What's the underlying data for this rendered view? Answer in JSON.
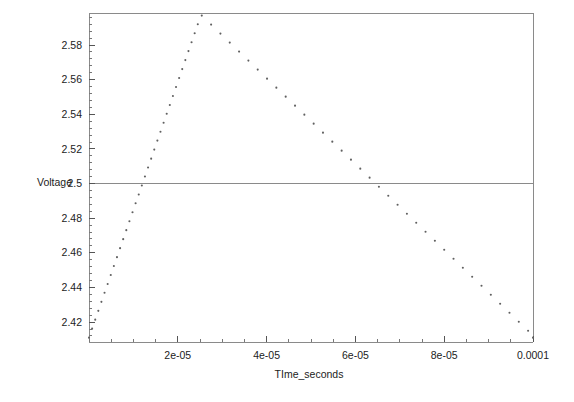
{
  "chart_data": {
    "type": "scatter",
    "title": "",
    "xlabel": "TIme_seconds",
    "ylabel": "Voltage",
    "xlim": [
      0,
      0.0001
    ],
    "ylim": [
      2.4085,
      2.5985
    ],
    "grid": false,
    "legend": null,
    "marker": "dot",
    "marker_color": "#606060",
    "reference_lines": [
      {
        "axis": "y",
        "value": 2.5,
        "color": "#8a8a8a"
      }
    ],
    "x_major_ticks": [
      2e-05,
      4e-05,
      6e-05,
      8e-05,
      0.0001
    ],
    "x_major_tick_labels": [
      "2e-05",
      "4e-05",
      "6e-05",
      "8e-05",
      "0.0001"
    ],
    "x_minor_tick_step": 5e-06,
    "y_major_ticks": [
      2.42,
      2.44,
      2.46,
      2.48,
      2.5,
      2.52,
      2.54,
      2.56,
      2.58
    ],
    "y_major_tick_labels": [
      "2.42",
      "2.44",
      "2.46",
      "2.48",
      "2.5",
      "2.52",
      "2.54",
      "2.56",
      "2.58"
    ],
    "y_minor_tick_step": 0.004,
    "series": [
      {
        "name": "Voltage",
        "x": [
          0.0,
          7e-07,
          1.4e-06,
          2.1e-06,
          2.8e-06,
          3.5e-06,
          4.2e-06,
          4.9e-06,
          5.6e-06,
          6.3e-06,
          7e-06,
          7.7e-06,
          8.4e-06,
          9.1e-06,
          9.8e-06,
          1.05e-05,
          1.12e-05,
          1.19e-05,
          1.26e-05,
          1.33e-05,
          1.4e-05,
          1.47e-05,
          1.54e-05,
          1.61e-05,
          1.68e-05,
          1.75e-05,
          1.82e-05,
          1.89e-05,
          1.96e-05,
          2.03e-05,
          2.1e-05,
          2.17e-05,
          2.24e-05,
          2.31e-05,
          2.38e-05,
          2.45e-05,
          2.54e-05,
          2.75e-05,
          2.96e-05,
          3.17e-05,
          3.38e-05,
          3.59e-05,
          3.8e-05,
          4.01e-05,
          4.22e-05,
          4.43e-05,
          4.64e-05,
          4.85e-05,
          5.06e-05,
          5.27e-05,
          5.48e-05,
          5.69e-05,
          5.9e-05,
          6.11e-05,
          6.32e-05,
          6.53e-05,
          6.74e-05,
          6.95e-05,
          7.16e-05,
          7.37e-05,
          7.58e-05,
          7.79e-05,
          8e-05,
          8.21e-05,
          8.42e-05,
          8.63e-05,
          8.84e-05,
          9.05e-05,
          9.26e-05,
          9.47e-05,
          9.68e-05,
          9.89e-05,
          0.0001
        ],
        "y": [
          2.411,
          2.4162,
          2.4214,
          2.4265,
          2.4317,
          2.4369,
          2.442,
          2.4472,
          2.4524,
          2.4575,
          2.4627,
          2.4679,
          2.4731,
          2.4782,
          2.4834,
          2.4886,
          2.4937,
          2.4989,
          2.5041,
          2.5093,
          2.5144,
          2.5196,
          2.5248,
          2.5299,
          2.5351,
          2.5403,
          2.5454,
          2.5506,
          2.5558,
          2.561,
          2.5661,
          2.5713,
          2.5765,
          2.5816,
          2.5868,
          2.592,
          2.597,
          2.5918,
          2.5866,
          2.5814,
          2.5762,
          2.571,
          2.5658,
          2.5606,
          2.5554,
          2.5502,
          2.545,
          2.5398,
          2.5346,
          2.5294,
          2.5242,
          2.519,
          2.5138,
          2.5086,
          2.5034,
          2.4982,
          2.493,
          2.4878,
          2.4826,
          2.4774,
          2.4722,
          2.467,
          2.4618,
          2.4566,
          2.4514,
          2.4462,
          2.441,
          2.4358,
          2.4306,
          2.4254,
          2.4202,
          2.415,
          2.411
        ]
      }
    ]
  },
  "labels": {
    "y_axis_title": "Voltage",
    "x_axis_title": "TIme_seconds"
  }
}
